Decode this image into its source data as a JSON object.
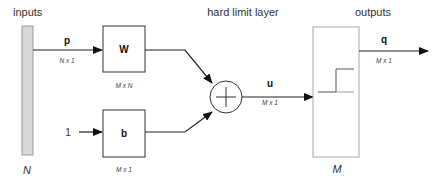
{
  "diagram": {
    "title_inputs": "inputs",
    "title_layer": "hard limit layer",
    "title_outputs": "outputs",
    "input_vector": {
      "symbol": "p",
      "dim": "N x 1",
      "size_label": "N"
    },
    "weight": {
      "symbol": "W",
      "dim": "M x N"
    },
    "bias_input": {
      "value": "1"
    },
    "bias": {
      "symbol": "b",
      "dim": "M x 1"
    },
    "summer": {
      "symbol": "+"
    },
    "net_input": {
      "symbol": "u",
      "dim": "M x 1"
    },
    "transfer": {
      "name": "hard limit",
      "size_label": "M"
    },
    "output": {
      "symbol": "q",
      "dim": "M x 1"
    },
    "colors": {
      "line": "#222222",
      "input_bar_fill": "#d9d9d9",
      "input_bar_stroke": "#9a9a9a",
      "layer_box_stroke": "#a8a8a8",
      "block_stroke": "#333333"
    }
  }
}
